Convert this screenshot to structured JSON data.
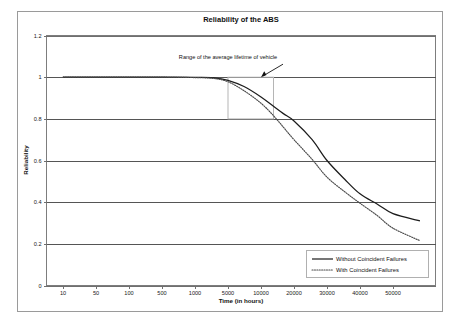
{
  "chart_data": {
    "type": "line",
    "title": "Reliability of the ABS",
    "xlabel": "Time (in hours)",
    "ylabel": "Reliability",
    "grid": true,
    "legend_position": "bottom-right",
    "x_scale": "log-categorical",
    "ylim": [
      0,
      1.2
    ],
    "y_ticks": [
      "0",
      "0.2",
      "0.4",
      "0.6",
      "0.8",
      "1",
      "1.2"
    ],
    "y_tick_values": [
      0,
      0.2,
      0.4,
      0.6,
      0.8,
      1.0,
      1.2
    ],
    "x_ticks": [
      "10",
      "50",
      "100",
      "500",
      "1000",
      "5000",
      "10000",
      "20000",
      "30000",
      "40000",
      "50000"
    ],
    "x_tick_values": [
      10,
      50,
      100,
      500,
      1000,
      5000,
      10000,
      20000,
      30000,
      40000,
      50000
    ],
    "series": [
      {
        "name": "Without Coincident Failures",
        "style": "solid",
        "color": "#1c1c1c",
        "x": [
          10,
          50,
          100,
          500,
          1000,
          2500,
          5000,
          7000,
          10000,
          13000,
          16000,
          20000,
          25000,
          30000,
          35000,
          40000,
          45000,
          50000,
          60000
        ],
        "values": [
          1.0,
          1.0,
          1.0,
          1.0,
          0.999,
          0.997,
          0.985,
          0.955,
          0.905,
          0.86,
          0.825,
          0.79,
          0.7,
          0.6,
          0.51,
          0.44,
          0.39,
          0.345,
          0.31
        ]
      },
      {
        "name": "With Coincident Failures",
        "style": "dotted",
        "color": "#4a4a4a",
        "x": [
          10,
          50,
          100,
          500,
          1000,
          2500,
          5000,
          7000,
          10000,
          13000,
          16000,
          20000,
          25000,
          30000,
          35000,
          40000,
          45000,
          50000,
          60000
        ],
        "values": [
          1.0,
          1.0,
          1.0,
          1.0,
          0.998,
          0.994,
          0.978,
          0.935,
          0.875,
          0.815,
          0.76,
          0.7,
          0.605,
          0.52,
          0.45,
          0.395,
          0.335,
          0.275,
          0.215
        ]
      }
    ],
    "annotations": [
      {
        "text": "Range of the average lifetime of vehicle",
        "arrow_target_x": 10000,
        "arrow_target_y": 1.0
      }
    ],
    "highlight_region": {
      "x_start": 5000,
      "x_end": 13000,
      "y_bottom": 0.8,
      "y_top": 1.0
    }
  },
  "legend": {
    "items": [
      {
        "label": "Without Coincident Failures"
      },
      {
        "label": "With Coincident Failures"
      }
    ]
  }
}
